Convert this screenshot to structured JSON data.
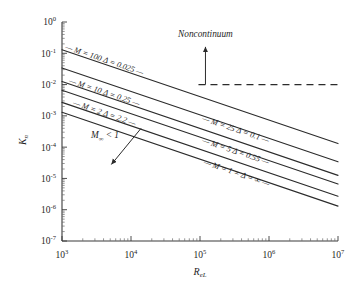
{
  "chart_data": {
    "type": "line",
    "title": "",
    "xlabel": "R_eL",
    "xlabel_main": "R",
    "xlabel_sub": "eL",
    "ylabel": "K_n",
    "ylabel_main": "K",
    "ylabel_sub": "n",
    "xscale": "log",
    "yscale": "log",
    "xlim": [
      1000,
      10000000
    ],
    "ylim": [
      1e-07,
      1
    ],
    "grid": false,
    "legend_position": "inline-curve-labels",
    "xticks": [
      {
        "value": 1000,
        "mantissa": "10",
        "exponent": "3"
      },
      {
        "value": 10000,
        "mantissa": "10",
        "exponent": "4"
      },
      {
        "value": 100000,
        "mantissa": "10",
        "exponent": "5"
      },
      {
        "value": 1000000,
        "mantissa": "10",
        "exponent": "6"
      },
      {
        "value": 10000000,
        "mantissa": "10",
        "exponent": "7"
      }
    ],
    "yticks": [
      {
        "value": 1,
        "mantissa": "10",
        "exponent": "0"
      },
      {
        "value": 0.1,
        "mantissa": "10",
        "exponent": "-1"
      },
      {
        "value": 0.01,
        "mantissa": "10",
        "exponent": "-2"
      },
      {
        "value": 0.001,
        "mantissa": "10",
        "exponent": "-3"
      },
      {
        "value": 0.0001,
        "mantissa": "10",
        "exponent": "-4"
      },
      {
        "value": 1e-05,
        "mantissa": "10",
        "exponent": "-5"
      },
      {
        "value": 1e-06,
        "mantissa": "10",
        "exponent": "-6"
      },
      {
        "value": 1e-07,
        "mantissa": "10",
        "exponent": "-7"
      }
    ],
    "series": [
      {
        "name": "M = 100  Δ = 0.025",
        "label": "M = 100 Δ = 0.025",
        "x": [
          1000,
          10000000
        ],
        "y": [
          0.13,
          0.00013
        ],
        "label_x": 4000,
        "label_y": 0.052
      },
      {
        "name": "M = 25  Δ = 0.1",
        "label": "M = 25 Δ = 0.1",
        "x": [
          1000,
          10000000
        ],
        "y": [
          0.034,
          3.4e-05
        ],
        "label_x": 320000,
        "label_y": 0.00031
      },
      {
        "name": "M = 10  Δ = 0.25",
        "label": "M = 10 Δ = 0.25",
        "x": [
          1000,
          10000000
        ],
        "y": [
          0.0125,
          1.25e-05
        ],
        "label_x": 4000,
        "label_y": 0.0048
      },
      {
        "name": "M = 5  Δ = 0.55",
        "label": "M = 5 Δ = 0.55",
        "x": [
          1000,
          10000000
        ],
        "y": [
          0.0066,
          6.6e-06
        ],
        "label_x": 320000,
        "label_y": 6.2e-05
      },
      {
        "name": "M = 2  Δ = 2.2",
        "label": "M = 2 Δ = 2.2",
        "x": [
          1000,
          10000000
        ],
        "y": [
          0.0027,
          2.7e-06
        ],
        "label_x": 4000,
        "label_y": 0.00103
      },
      {
        "name": "M = 1 = Δ = ∞",
        "label": "M = 1 = Δ = ∞",
        "x": [
          1000,
          10000000
        ],
        "y": [
          0.0013,
          1.3e-06
        ],
        "label_x": 330000,
        "label_y": 1.25e-05
      }
    ],
    "reference_line": {
      "name": "continuum-limit",
      "type": "horizontal-dashed",
      "y": 0.01,
      "x_start": 95000,
      "x_end": 10000000
    },
    "annotations": [
      {
        "name": "noncontinuum",
        "text": "Noncontinuum",
        "x": 120000,
        "y": 0.33,
        "arrow": {
          "from_x": 120000,
          "from_y": 0.01,
          "to_x": 120000,
          "to_y": 0.16
        }
      },
      {
        "name": "mach-subsonic",
        "text": "M",
        "sub": "∞",
        "text_tail": " < 1",
        "full_text": "M∞ < 1",
        "x": 4200,
        "y": 0.00019,
        "arrow": {
          "from_x": 14000,
          "from_y": 0.0004,
          "to_x": 5200,
          "to_y": 2.8e-05
        }
      }
    ]
  },
  "figure": {
    "background_color": "#ffffff",
    "line_color": "#2b2b2b",
    "axis_color": "#3a3a3a",
    "text_color": "#1f1f1f"
  }
}
